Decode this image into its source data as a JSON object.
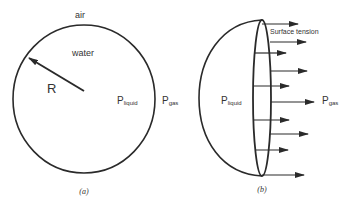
{
  "figure": {
    "stroke_color": "#2a2a2a",
    "text_color": "#333333",
    "panel_a": {
      "caption": "(a)",
      "outside_label": "air",
      "inside_label": "water",
      "radius_label": "R",
      "p_liquid": {
        "main": "P",
        "sub": "liquid"
      },
      "p_gas": {
        "main": "P",
        "sub": "gas"
      }
    },
    "panel_b": {
      "caption": "(b)",
      "force_label": "Surface tension",
      "p_liquid": {
        "main": "P",
        "sub": "liquid"
      },
      "p_gas": {
        "main": "P",
        "sub": "gas"
      },
      "arrows": [
        {
          "y": 24,
          "x1": 262,
          "x2": 298,
          "side": "surface"
        },
        {
          "y": 42,
          "x1": 270,
          "x2": 306,
          "side": "outer"
        },
        {
          "y": 53,
          "x1": 255,
          "x2": 286,
          "side": "inner"
        },
        {
          "y": 71,
          "x1": 271,
          "x2": 307,
          "side": "outer"
        },
        {
          "y": 86,
          "x1": 253,
          "x2": 289,
          "side": "inner"
        },
        {
          "y": 102,
          "x1": 271,
          "x2": 314,
          "side": "outer"
        },
        {
          "y": 120,
          "x1": 253,
          "x2": 289,
          "side": "inner"
        },
        {
          "y": 134,
          "x1": 270,
          "x2": 308,
          "side": "outer"
        },
        {
          "y": 150,
          "x1": 255,
          "x2": 288,
          "side": "inner"
        },
        {
          "y": 175,
          "x1": 262,
          "x2": 304,
          "side": "bottom"
        }
      ]
    }
  }
}
